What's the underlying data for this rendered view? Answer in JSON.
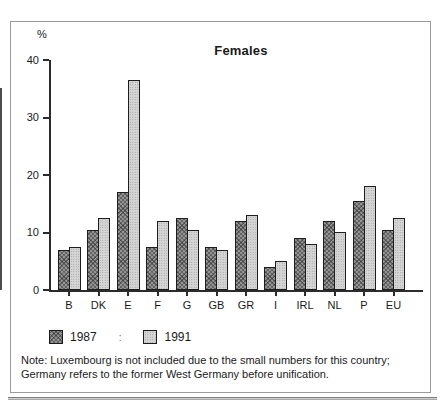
{
  "figure": {
    "percent_label": "%",
    "note_lines": [
      "Note: Luxembourg is not included due to the small numbers for this country;",
      "Germany refers to the former West Germany before unification."
    ]
  },
  "legend": {
    "separator": ":"
  },
  "chart_data": {
    "type": "bar",
    "title": "Females",
    "xlabel": "",
    "ylabel": "%",
    "ylim": [
      0,
      40
    ],
    "yticks": [
      0,
      10,
      20,
      30,
      40
    ],
    "grid": false,
    "legend_position": "below-left",
    "categories": [
      "B",
      "DK",
      "E",
      "F",
      "G",
      "GB",
      "GR",
      "I",
      "IRL",
      "NL",
      "P",
      "EU"
    ],
    "series": [
      {
        "name": "1987",
        "pattern": "crosshatch",
        "color": "#949494",
        "values": [
          7,
          10.5,
          17,
          7.5,
          12.5,
          7.5,
          12,
          4,
          9,
          12,
          15.5,
          10.5
        ]
      },
      {
        "name": "1991",
        "pattern": "dots",
        "color": "#d5d5d5",
        "values": [
          7.5,
          12.5,
          36.5,
          12,
          10.5,
          7,
          13,
          5,
          8,
          10,
          18,
          12.5
        ]
      }
    ]
  }
}
